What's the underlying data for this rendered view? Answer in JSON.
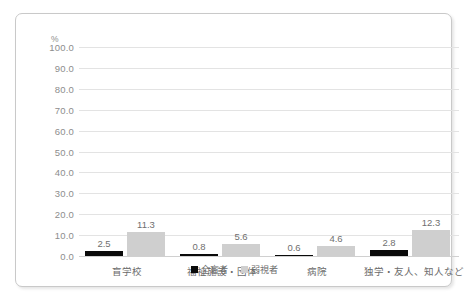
{
  "chart_data": {
    "type": "bar",
    "title": "",
    "xlabel": "",
    "ylabel": "%",
    "unit_label": "%",
    "ylim": [
      0,
      100
    ],
    "ytick_step": 10,
    "yticks": [
      "100.0",
      "90.0",
      "80.0",
      "70.0",
      "60.0",
      "50.0",
      "40.0",
      "30.0",
      "20.0",
      "10.0",
      "0.0"
    ],
    "ytick_values": [
      100,
      90,
      80,
      70,
      60,
      50,
      40,
      30,
      20,
      10,
      0
    ],
    "grid": true,
    "legend_position": "bottom-center",
    "categories": [
      "盲学校",
      "福祉施設・団体",
      "病院",
      "独学・友人、知人など"
    ],
    "series": [
      {
        "name": "全盲者",
        "color": "#0a0a0a",
        "values": [
          2.5,
          0.8,
          0.6,
          2.8
        ],
        "labels": [
          "2.5",
          "0.8",
          "0.6",
          "2.8"
        ]
      },
      {
        "name": "弱視者",
        "color": "#cfcfcf",
        "values": [
          11.3,
          5.6,
          4.6,
          12.3
        ],
        "labels": [
          "11.3",
          "5.6",
          "4.6",
          "12.3"
        ]
      }
    ]
  },
  "legend": {
    "items": [
      {
        "label": "全盲者",
        "color": "#0a0a0a"
      },
      {
        "label": "弱視者",
        "color": "#cfcfcf"
      }
    ]
  }
}
